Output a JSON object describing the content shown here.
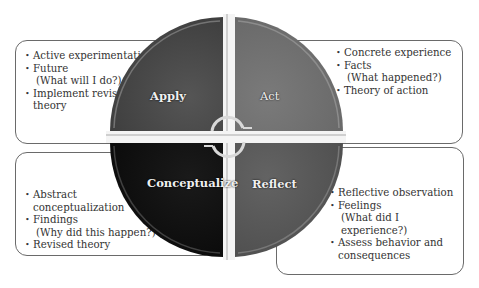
{
  "diagram": {
    "type": "cycle-wheel",
    "center": {
      "x": 229,
      "y": 137
    },
    "colors": {
      "apply": "#4a4a4a",
      "act": "#6f6f6f",
      "conceptualize": "#111111",
      "reflect": "#5a5a5a",
      "divider": "#d8d8d8",
      "box_border": "#6a6a6a",
      "text": "#333333"
    },
    "quadrants": [
      {
        "id": "apply",
        "label": "Apply",
        "position": "top-left",
        "items": [
          {
            "text": "Active experimentation"
          },
          {
            "text": "Future",
            "sub": "(What will I do?)"
          },
          {
            "text": "Implement revised",
            "sub": "theory"
          }
        ]
      },
      {
        "id": "act",
        "label": "Act",
        "position": "top-right",
        "items": [
          {
            "text": "Concrete experience"
          },
          {
            "text": "Facts",
            "sub": "(What happened?)"
          },
          {
            "text": "Theory of action"
          }
        ]
      },
      {
        "id": "conceptualize",
        "label": "Conceptualize",
        "position": "bottom-left",
        "items": [
          {
            "text": "Abstract",
            "sub": "conceptualization"
          },
          {
            "text": "Findings",
            "sub": "(Why did this happen?)"
          },
          {
            "text": "Revised theory"
          }
        ]
      },
      {
        "id": "reflect",
        "label": "Reflect",
        "position": "bottom-right",
        "items": [
          {
            "text": "Reflective observation"
          },
          {
            "text": "Feelings",
            "sub": "(What did I experience?)"
          },
          {
            "text": "Assess behavior and",
            "sub": "consequences"
          }
        ]
      }
    ],
    "center_icon": "cycle-arrows-icon"
  }
}
